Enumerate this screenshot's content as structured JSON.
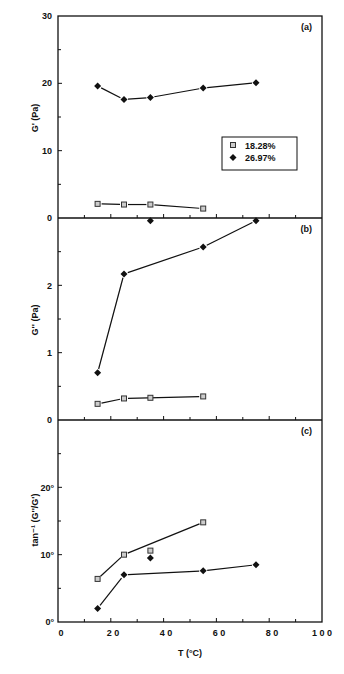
{
  "chart_data": [
    {
      "type": "line",
      "panel_label": "(a)",
      "ylabel": "G' (Pa)",
      "xlabel": "",
      "ylim": [
        0,
        30
      ],
      "yticks": [
        "0",
        "10",
        "20",
        "30"
      ],
      "xlim": [
        0,
        100
      ],
      "legend": [
        "18.28%",
        "26.97%"
      ],
      "series": [
        {
          "name": "18.28%",
          "marker": "square",
          "x": [
            15,
            25,
            35,
            55
          ],
          "values": [
            2.1,
            2.0,
            2.0,
            1.4
          ]
        },
        {
          "name": "26.97%",
          "marker": "diamond",
          "x": [
            15,
            25,
            35,
            55,
            75
          ],
          "values": [
            19.6,
            17.6,
            17.9,
            19.3,
            20.1
          ]
        }
      ]
    },
    {
      "type": "line",
      "panel_label": "(b)",
      "ylabel": "G'' (Pa)",
      "xlabel": "",
      "ylim": [
        0,
        3
      ],
      "yticks": [
        "0",
        "1",
        "2"
      ],
      "xlim": [
        0,
        100
      ],
      "series": [
        {
          "name": "18.28%",
          "marker": "square",
          "x": [
            15,
            25,
            35,
            55
          ],
          "values": [
            0.24,
            0.32,
            0.33,
            0.35
          ]
        },
        {
          "name": "26.97%",
          "marker": "diamond",
          "x": [
            15,
            25,
            35,
            55,
            75
          ],
          "values": [
            0.7,
            2.17,
            2.96,
            2.57,
            2.96
          ]
        }
      ]
    },
    {
      "type": "line",
      "panel_label": "(c)",
      "ylabel": "tan-1 (G''/G')",
      "xlabel": "T (°C)",
      "ylim": [
        0,
        30
      ],
      "yticks": [
        "0°",
        "10°",
        "20°"
      ],
      "xlim": [
        0,
        100
      ],
      "xticks": [
        "0",
        "2 0",
        "4 0",
        "6 0",
        "8 0",
        "1 0 0"
      ],
      "series": [
        {
          "name": "18.28%",
          "marker": "square",
          "x": [
            15,
            25,
            35,
            55
          ],
          "values": [
            6.4,
            10.0,
            10.6,
            14.8
          ]
        },
        {
          "name": "26.97%",
          "marker": "diamond",
          "x": [
            15,
            25,
            35,
            55,
            75
          ],
          "values": [
            2.0,
            7.0,
            9.5,
            7.6,
            8.5
          ]
        }
      ]
    }
  ],
  "labels": {
    "panel_a": "(a)",
    "panel_b": "(b)",
    "panel_c": "(c)",
    "ylabel_a": "G' (Pa)",
    "ylabel_b": "G'' (Pa)",
    "ylabel_c": "tan⁻¹  (G''/G')",
    "xlabel": "T (°C)",
    "legend_1": "18.28%",
    "legend_2": "26.97%",
    "ya": [
      "0",
      "10",
      "20",
      "30"
    ],
    "yb": [
      "0",
      "1",
      "2"
    ],
    "yc": [
      "0°",
      "10°",
      "20°"
    ],
    "x": [
      "0",
      "2 0",
      "4 0",
      "6 0",
      "8 0",
      "1 0 0"
    ]
  }
}
